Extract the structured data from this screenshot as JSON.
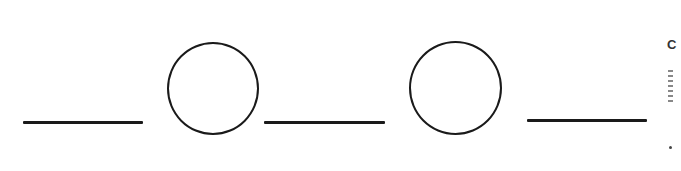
{
  "diagram": {
    "sequence": [
      "blank",
      "circle",
      "blank",
      "circle",
      "blank"
    ],
    "stroke_color": "#1a1a1a",
    "background_color": "#ffffff",
    "blanks": [
      {
        "id": "blank-1",
        "x": 23,
        "y": 121,
        "width": 120
      },
      {
        "id": "blank-2",
        "x": 264,
        "y": 121,
        "width": 121
      },
      {
        "id": "blank-3",
        "x": 527,
        "y": 119,
        "width": 120
      }
    ],
    "circles": [
      {
        "id": "circle-1",
        "cx": 213,
        "cy": 88,
        "r": 46
      },
      {
        "id": "circle-2",
        "cx": 455,
        "cy": 88,
        "r": 46
      }
    ],
    "right_edge_cutoff": {
      "glyph": "C"
    }
  }
}
